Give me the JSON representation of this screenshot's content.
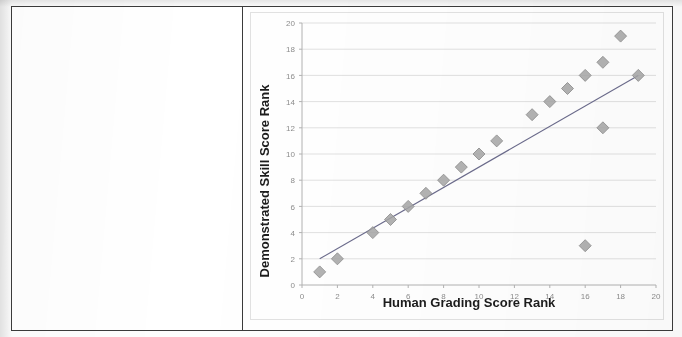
{
  "document": {
    "table": {
      "left_cell_text": "",
      "right_cell_name": "chart-cell"
    }
  },
  "chart_data": {
    "type": "scatter",
    "title": "",
    "xlabel": "Human Grading Score Rank",
    "ylabel": "Demonstrated Skill Score Rank",
    "xlim": [
      0,
      20
    ],
    "ylim": [
      0,
      20
    ],
    "xticks": [
      0,
      2,
      4,
      6,
      8,
      10,
      12,
      14,
      16,
      18,
      20
    ],
    "yticks": [
      0,
      2,
      4,
      6,
      8,
      10,
      12,
      14,
      16,
      18,
      20
    ],
    "xtick_labels": [
      "0",
      "2",
      "4",
      "6",
      "8",
      "10",
      "12",
      "14",
      "16",
      "18",
      "20"
    ],
    "ytick_labels": [
      "0",
      "2",
      "4",
      "6",
      "8",
      "10",
      "12",
      "14",
      "16",
      "18",
      "20"
    ],
    "grid": {
      "horizontal": true,
      "vertical": false,
      "color": "#d9d9d9"
    },
    "legend": {
      "visible": false,
      "position": "none"
    },
    "marker": {
      "shape": "diamond",
      "fill": "#a6a6a6",
      "stroke": "#8c8c8c",
      "size": 6
    },
    "trendline": {
      "visible": true,
      "color": "#6b6b8c",
      "x": [
        1,
        19
      ],
      "y": [
        2,
        16
      ]
    },
    "series": [
      {
        "name": "Rank pairs",
        "points": [
          {
            "x": 1,
            "y": 1
          },
          {
            "x": 2,
            "y": 2
          },
          {
            "x": 4,
            "y": 4
          },
          {
            "x": 5,
            "y": 5
          },
          {
            "x": 6,
            "y": 6
          },
          {
            "x": 7,
            "y": 7
          },
          {
            "x": 8,
            "y": 8
          },
          {
            "x": 9,
            "y": 9
          },
          {
            "x": 10,
            "y": 10
          },
          {
            "x": 11,
            "y": 11
          },
          {
            "x": 13,
            "y": 13
          },
          {
            "x": 14,
            "y": 14
          },
          {
            "x": 15,
            "y": 15
          },
          {
            "x": 16,
            "y": 16
          },
          {
            "x": 16,
            "y": 3
          },
          {
            "x": 17,
            "y": 17
          },
          {
            "x": 17,
            "y": 12
          },
          {
            "x": 18,
            "y": 19
          },
          {
            "x": 19,
            "y": 16
          }
        ]
      }
    ]
  }
}
